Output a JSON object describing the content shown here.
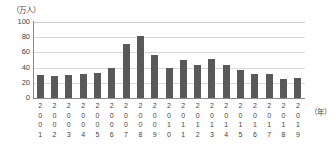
{
  "chart_data": {
    "type": "bar",
    "title": "",
    "subtitle": "",
    "unit_label": "（万人）",
    "xlabel": "（年）",
    "ylabel": "",
    "ylim": [
      0,
      100
    ],
    "yticks": [
      100,
      80,
      60,
      40,
      20,
      0
    ],
    "grid": true,
    "legend": "none",
    "bar_color": "#595959",
    "gridline_color": "#d9d9d9",
    "axis_color": "#8c8c8c",
    "categories": [
      "2001",
      "2002",
      "2003",
      "2004",
      "2005",
      "2006",
      "2007",
      "2008",
      "2009",
      "2010",
      "2011",
      "2012",
      "2013",
      "2014",
      "2015",
      "2016",
      "2017",
      "2018",
      "2019"
    ],
    "values": [
      30,
      29,
      30,
      31,
      33,
      39,
      71,
      81,
      57,
      39,
      50,
      44,
      51,
      44,
      37,
      31,
      32,
      25,
      26
    ]
  }
}
